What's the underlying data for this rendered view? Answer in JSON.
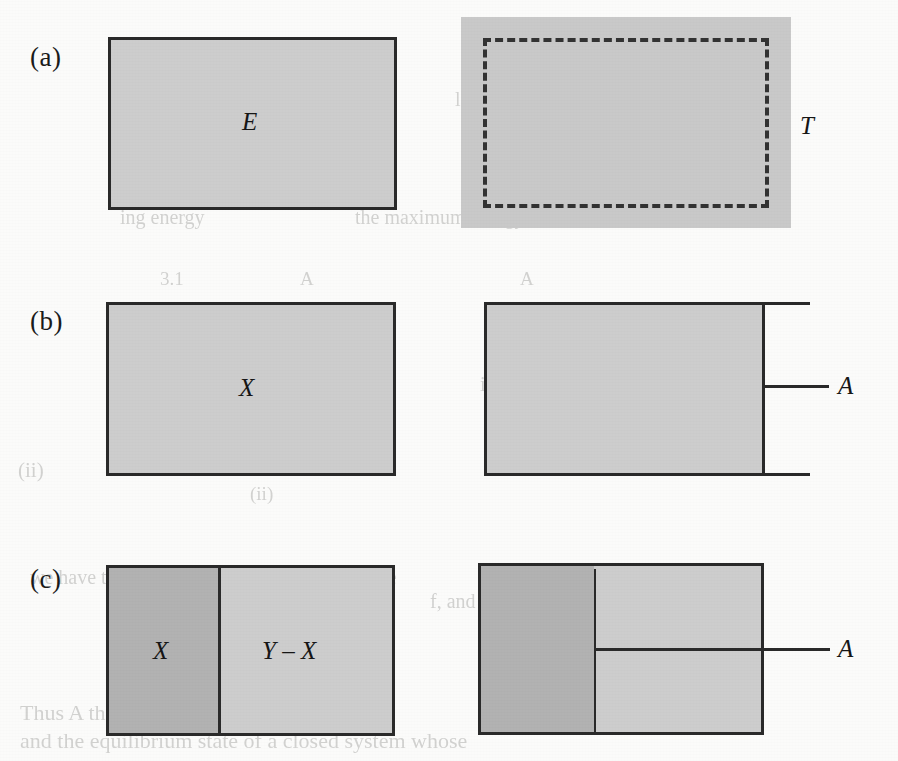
{
  "figure": {
    "type": "scanned-textbook-diagram",
    "panels": [
      {
        "id": "a",
        "label": "(a)",
        "left_shape": {
          "kind": "solid-bordered-rectangle",
          "fill": "#cdcdcd",
          "label": "E"
        },
        "right_shape": {
          "kind": "filled-rectangle-with-dashed-inner-rectangle",
          "fill": "#c9c9c9",
          "label": "T"
        }
      },
      {
        "id": "b",
        "label": "(b)",
        "left_shape": {
          "kind": "solid-bordered-rectangle",
          "fill": "#cdcdcd",
          "label": "X"
        },
        "right_shape": {
          "kind": "rectangle-with-extended-edges-and-pointer",
          "fill": "#cdcdcd",
          "label": "A"
        }
      },
      {
        "id": "c",
        "label": "(c)",
        "left_shape": {
          "kind": "split-rectangle",
          "left_fill": "#b2b2b2",
          "right_fill": "#cdcdcd",
          "left_label": "X",
          "right_label": "Y – X"
        },
        "right_shape": {
          "kind": "split-rectangle-with-pointer",
          "left_fill": "#b2b2b2",
          "right_fill": "#cdcdcd",
          "label": "A"
        }
      }
    ]
  },
  "labels": {
    "panel_a": "(a)",
    "panel_b": "(b)",
    "panel_c": "(c)",
    "E": "E",
    "T": "T",
    "X": "X",
    "A_b": "A",
    "X_c": "X",
    "Y_minus_X": "Y – X",
    "A_c": "A"
  },
  "colors": {
    "ink": "#2a2a2a",
    "fill_light": "#cdcdcd",
    "fill_dark": "#b2b2b2",
    "fill_plain": "#c9c9c9",
    "paper": "#fbfbfa"
  },
  "background_text": {
    "note": "faint bleed-through text from the reverse side of the scanned page",
    "lines": [
      {
        "text": "ing energy",
        "x": 120,
        "y": 218,
        "size": 20
      },
      {
        "text": "the maximum energy, to",
        "x": 355,
        "y": 218,
        "size": 20
      },
      {
        "text": "lar gas have a",
        "x": 455,
        "y": 100,
        "size": 20
      },
      {
        "text": "3.1",
        "x": 160,
        "y": 280,
        "size": 19
      },
      {
        "text": "A",
        "x": 300,
        "y": 280,
        "size": 19
      },
      {
        "text": "A",
        "x": 520,
        "y": 280,
        "size": 19
      },
      {
        "text": "where is given by",
        "x": 210,
        "y": 385,
        "size": 20
      },
      {
        "text": "in the 2 system, where to be",
        "x": 480,
        "y": 385,
        "size": 20
      },
      {
        "text": "simply written as",
        "x": 540,
        "y": 412,
        "size": 20
      },
      {
        "text": "(ii)",
        "x": 18,
        "y": 470,
        "size": 21
      },
      {
        "text": "(ii)",
        "x": 250,
        "y": 495,
        "size": 19
      },
      {
        "text": "we have to compare       system to  Y  and from the",
        "x": 30,
        "y": 578,
        "size": 20
      },
      {
        "text": "f, and it can be inferred",
        "x": 430,
        "y": 602,
        "size": 20
      },
      {
        "text": "Thus A  the condition",
        "x": 20,
        "y": 712,
        "size": 22
      },
      {
        "text": "and the equilibrium state of a closed system whose",
        "x": 20,
        "y": 740,
        "size": 22
      }
    ]
  }
}
